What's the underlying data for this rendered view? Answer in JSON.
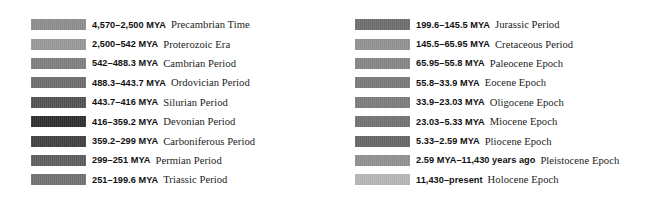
{
  "figure": {
    "kind": "geologic-time-scale-legend",
    "background_color": "#ffffff",
    "columns": 2
  },
  "left_column": {
    "start_y": 15,
    "row_pitch": 19.4,
    "entries": [
      {
        "range": "4,570–2,500 MYA",
        "name": "Precambrian Time",
        "swatch_color": "#8a8a8a"
      },
      {
        "range": "2,500–542 MYA",
        "name": "Proterozoic Era",
        "swatch_color": "#949494"
      },
      {
        "range": "542–488.3 MYA",
        "name": "Cambrian Period",
        "swatch_color": "#7c7c7c"
      },
      {
        "range": "488.3–443.7 MYA",
        "name": "Ordovician Period",
        "swatch_color": "#6a6a6a"
      },
      {
        "range": "443.7–416 MYA",
        "name": "Silurian Period",
        "swatch_color": "#4e4e4e"
      },
      {
        "range": "416–359.2 MYA",
        "name": "Devonian Period",
        "swatch_color": "#2c2c2c"
      },
      {
        "range": "359.2–299 MYA",
        "name": "Carboniferous Period",
        "swatch_color": "#3e3e3e"
      },
      {
        "range": "299–251 MYA",
        "name": "Permian Period",
        "swatch_color": "#5a5a5a"
      },
      {
        "range": "251–199.6 MYA",
        "name": "Triassic Period",
        "swatch_color": "#6e6e6e"
      }
    ]
  },
  "right_column": {
    "start_y": 15,
    "row_pitch": 19.4,
    "entries": [
      {
        "range": "199.6–145.5 MYA",
        "name": "Jurassic Period",
        "swatch_color": "#6b6b6b"
      },
      {
        "range": "145.5–65.95 MYA",
        "name": "Cretaceous Period",
        "swatch_color": "#8e8e8e"
      },
      {
        "range": "65.95–55.8 MYA",
        "name": "Paleocene Epoch",
        "swatch_color": "#828282"
      },
      {
        "range": "55.8–33.9 MYA",
        "name": "Eocene Epoch",
        "swatch_color": "#767676"
      },
      {
        "range": "33.9–23.03 MYA",
        "name": "Oligocene Epoch",
        "swatch_color": "#787878"
      },
      {
        "range": "23.03–5.33 MYA",
        "name": "Miocene Epoch",
        "swatch_color": "#6f6f6f"
      },
      {
        "range": "5.33–2.59 MYA",
        "name": "Pliocene Epoch",
        "swatch_color": "#636363"
      },
      {
        "range": "2.59 MYA–11,430 years ago",
        "name": "Pleistocene Epoch",
        "swatch_color": "#8c8c8c"
      },
      {
        "range": "11,430–present",
        "name": "Holocene Epoch",
        "swatch_color": "#b2b2b2"
      }
    ]
  }
}
